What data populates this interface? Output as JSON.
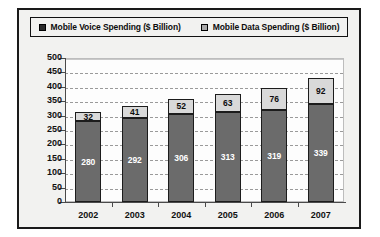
{
  "chart_data": {
    "type": "bar",
    "subtype": "stacked-column",
    "title": "",
    "xlabel": "",
    "ylabel": "",
    "categories": [
      "2002",
      "2003",
      "2004",
      "2005",
      "2006",
      "2007"
    ],
    "series": [
      {
        "name": "Mobile Voice Spending ($ Billion)",
        "color": "#6b6b6b",
        "label_color": "#ffffff",
        "values": [
          280,
          292,
          306,
          313,
          319,
          339
        ]
      },
      {
        "name": "Mobile Data Spending ($ Billion)",
        "color": "#d9d9d9",
        "label_color": "#0d0d0d",
        "values": [
          32,
          41,
          52,
          63,
          76,
          92
        ]
      }
    ],
    "totals": [
      312,
      333,
      358,
      376,
      395,
      431
    ],
    "ylim": [
      0,
      500
    ],
    "ytick_step": 50,
    "yticks": [
      "500",
      "450",
      "400",
      "350",
      "300",
      "250",
      "200",
      "150",
      "100",
      "50",
      "0"
    ],
    "grid": true,
    "legend_position": "top"
  },
  "legend": {
    "entries": [
      {
        "label": "Mobile Voice Spending ($ Billion)",
        "swatch": "#2b2b2b",
        "icon": "legend-square-icon"
      },
      {
        "label": "Mobile Data Spending ($ Billion)",
        "swatch": "#a8a8a8",
        "icon": "legend-square-icon"
      }
    ]
  }
}
